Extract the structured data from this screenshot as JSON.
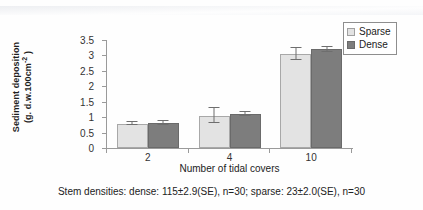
{
  "chart_data": {
    "type": "bar",
    "title": "",
    "xlabel": "Number of tidal covers",
    "ylabel_line1": "Sediment deposition",
    "ylabel_line2": "(g. d.w.100cm",
    "ylabel_exponent": "-2",
    "ylabel_line2_end": " )",
    "categories": [
      "2",
      "4",
      "10"
    ],
    "ylim": [
      0,
      3.5
    ],
    "yticks": [
      "0",
      "0.5",
      "1",
      "1.5",
      "2",
      "2.5",
      "3",
      "3.5"
    ],
    "ytick_values": [
      0,
      0.5,
      1,
      1.5,
      2,
      2.5,
      3,
      3.5
    ],
    "grid": false,
    "legend_position": "top-right",
    "series": [
      {
        "name": "Sparse",
        "color": "#e3e3e3",
        "values": [
          0.78,
          1.05,
          3.05
        ],
        "errors": [
          0.05,
          0.25,
          0.2
        ]
      },
      {
        "name": "Dense",
        "color": "#7d7d7d",
        "values": [
          0.8,
          1.1,
          3.2
        ],
        "errors": [
          0.06,
          0.07,
          0.08
        ]
      }
    ]
  },
  "legend": {
    "items": [
      {
        "label": "Sparse",
        "swatch": "sparse"
      },
      {
        "label": "Dense",
        "swatch": "dense"
      }
    ]
  },
  "caption": "Stem densities: dense: 115±2.9(SE), n=30; sparse: 23±2.0(SE), n=30"
}
